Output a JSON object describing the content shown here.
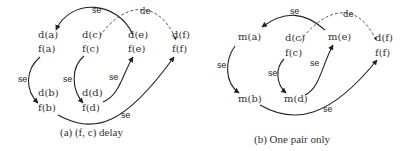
{
  "panels": [
    {
      "id": "a",
      "caption": "(a) (f, c) delay",
      "nodes": {
        "d_a": "d(a)",
        "f_a": "f(a)",
        "d_c": "d(c)",
        "f_c": "f(c)",
        "d_e": "d(e)",
        "f_e": "f(e)",
        "d_f": "d(f)",
        "f_f": "f(f)",
        "d_b": "d(b)",
        "f_b": "f(b)",
        "d_d": "d(d)",
        "f_d": "f(d)"
      },
      "edges": [
        {
          "from": "d(e)",
          "to": "d(a)",
          "label": "se",
          "style": "solid"
        },
        {
          "from": "d(c)",
          "to": "d(f)",
          "label": "de",
          "style": "dashed"
        },
        {
          "from": "f(a)",
          "to": "f(b)",
          "label": "se",
          "style": "solid"
        },
        {
          "from": "f(c)",
          "to": "f(d)",
          "label": "se",
          "style": "solid"
        },
        {
          "from": "f(d)",
          "to": "f(e)",
          "label": "se",
          "style": "solid"
        },
        {
          "from": "f(b)",
          "to": "f(f)",
          "label": "se",
          "style": "solid"
        }
      ]
    },
    {
      "id": "b",
      "caption": "(b) One pair only",
      "nodes": {
        "m_a": "m(a)",
        "d_c": "d(c)",
        "f_c": "f(c)",
        "m_e": "m(e)",
        "d_f": "d(f)",
        "f_f": "f(f)",
        "m_b": "m(b)",
        "m_d": "m(d)"
      },
      "edges": [
        {
          "from": "m(e)",
          "to": "m(a)",
          "label": "se",
          "style": "solid"
        },
        {
          "from": "d(c)",
          "to": "d(f)",
          "label": "de",
          "style": "dashed"
        },
        {
          "from": "m(a)",
          "to": "m(b)",
          "label": "se",
          "style": "solid"
        },
        {
          "from": "f(c)",
          "to": "m(d)",
          "label": "se",
          "style": "solid"
        },
        {
          "from": "m(d)",
          "to": "m(e)",
          "label": "se",
          "style": "solid"
        },
        {
          "from": "m(b)",
          "to": "f(f)",
          "label": "se",
          "style": "solid"
        }
      ]
    }
  ],
  "labels": {
    "se": "se",
    "de": "de"
  }
}
